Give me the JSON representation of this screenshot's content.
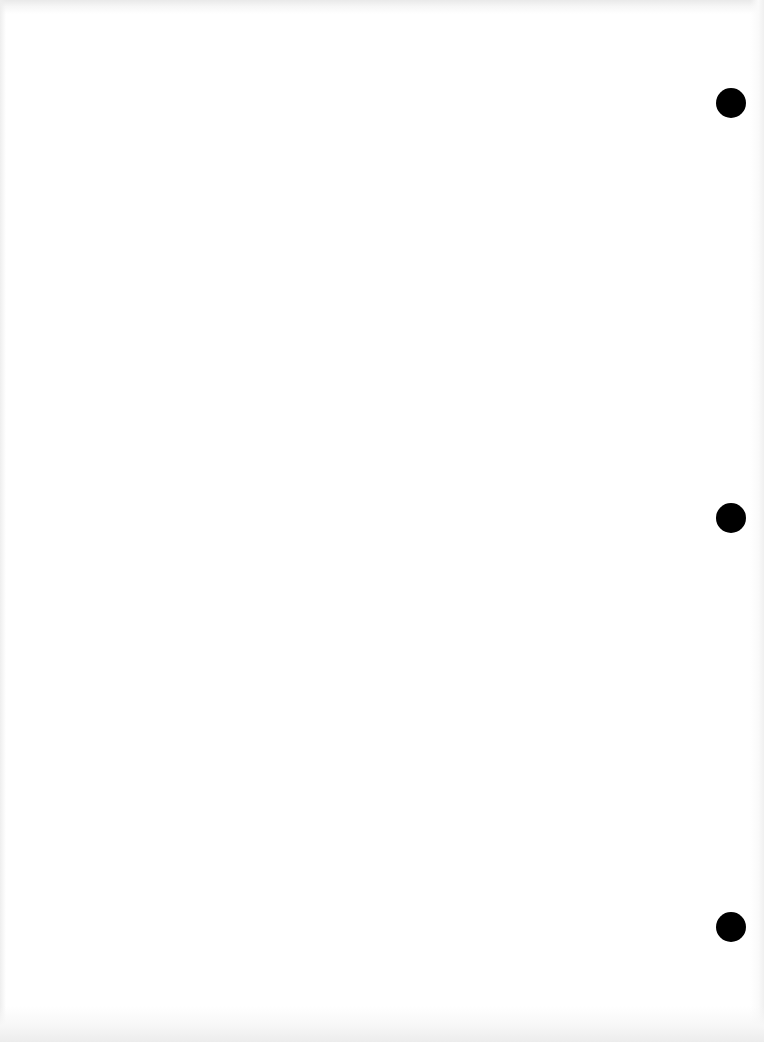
{
  "document": {
    "type": "blank-scanned-page",
    "background_color": "#ffffff",
    "hole_color": "#000000",
    "punch_holes": [
      {
        "cx": 731,
        "cy": 103,
        "r": 15
      },
      {
        "cx": 731,
        "cy": 518,
        "r": 15
      },
      {
        "cx": 731,
        "cy": 927,
        "r": 15
      }
    ]
  }
}
